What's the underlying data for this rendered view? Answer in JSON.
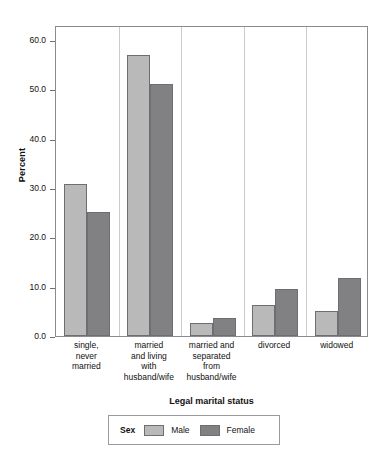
{
  "chart_data": {
    "type": "bar",
    "title": "",
    "xlabel": "Legal marital status",
    "ylabel": "Percent",
    "categories": [
      "single,\nnever\nmarried",
      "married\nand living\nwith\nhusband/wife",
      "married and\nseparated\nfrom\nhusband/wife",
      "divorced",
      "widowed"
    ],
    "series": [
      {
        "name": "Male",
        "color": "#b9b9b9",
        "values": [
          30.7,
          56.9,
          2.6,
          6.2,
          5.0
        ]
      },
      {
        "name": "Female",
        "color": "#818184",
        "values": [
          25.2,
          51.0,
          3.6,
          9.6,
          11.8
        ]
      }
    ],
    "ylim": [
      0,
      63
    ],
    "yticks": [
      0.0,
      10.0,
      20.0,
      30.0,
      40.0,
      50.0,
      60.0
    ],
    "ytick_labels": [
      "0.0",
      "10.0",
      "20.0",
      "30.0",
      "40.0",
      "50.0",
      "60.0"
    ],
    "grid": false,
    "legend": {
      "title": "Sex",
      "position": "bottom",
      "entries": [
        "Male",
        "Female"
      ]
    }
  }
}
